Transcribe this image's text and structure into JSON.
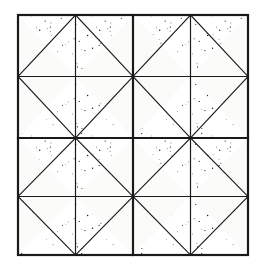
{
  "figure": {
    "background_color": "#ffffff",
    "paper_color": "#fbfbfa",
    "line_color": "#1a1a1a",
    "stipple_color": "#1c1c1c"
  },
  "pattern_data": {
    "type": "geometric-tiling",
    "grid_rows": 4,
    "grid_cols": 4,
    "frame": {
      "x": 18,
      "y": 15,
      "width": 230,
      "height": 240
    },
    "line_widths": {
      "outer_border": 2.2,
      "major_grid": 2.2,
      "minor_grid": 1.2,
      "diagonal": 1.1
    },
    "major_grid_lines": {
      "vertical_x": [
        133
      ],
      "horizontal_y": [
        138
      ]
    },
    "minor_grid_lines": {
      "vertical_x": [
        75.5,
        190.5
      ],
      "horizontal_y": [
        76.5,
        196.5
      ]
    },
    "cells": [
      {
        "row": 0,
        "col": 0,
        "diagonal": "tr-bl",
        "shaded_half": "tr"
      },
      {
        "row": 0,
        "col": 1,
        "diagonal": "tl-br",
        "shaded_half": "tl"
      },
      {
        "row": 0,
        "col": 2,
        "diagonal": "tr-bl",
        "shaded_half": "tr"
      },
      {
        "row": 0,
        "col": 3,
        "diagonal": "tl-br",
        "shaded_half": "tl"
      },
      {
        "row": 1,
        "col": 0,
        "diagonal": "tl-br",
        "shaded_half": "br"
      },
      {
        "row": 1,
        "col": 1,
        "diagonal": "tr-bl",
        "shaded_half": "bl"
      },
      {
        "row": 1,
        "col": 2,
        "diagonal": "tl-br",
        "shaded_half": "br"
      },
      {
        "row": 1,
        "col": 3,
        "diagonal": "tr-bl",
        "shaded_half": "bl"
      },
      {
        "row": 2,
        "col": 0,
        "diagonal": "tr-bl",
        "shaded_half": "tr"
      },
      {
        "row": 2,
        "col": 1,
        "diagonal": "tl-br",
        "shaded_half": "tl"
      },
      {
        "row": 2,
        "col": 2,
        "diagonal": "tr-bl",
        "shaded_half": "tr"
      },
      {
        "row": 2,
        "col": 3,
        "diagonal": "tl-br",
        "shaded_half": "tl"
      },
      {
        "row": 3,
        "col": 0,
        "diagonal": "tl-br",
        "shaded_half": "br"
      },
      {
        "row": 3,
        "col": 1,
        "diagonal": "tr-bl",
        "shaded_half": "bl"
      },
      {
        "row": 3,
        "col": 2,
        "diagonal": "tl-br",
        "shaded_half": "br"
      },
      {
        "row": 3,
        "col": 3,
        "diagonal": "tr-bl",
        "shaded_half": "bl"
      }
    ],
    "stipple": {
      "style": "random-dot",
      "dot_radius": 0.45,
      "density_per_100px2": 95
    }
  }
}
